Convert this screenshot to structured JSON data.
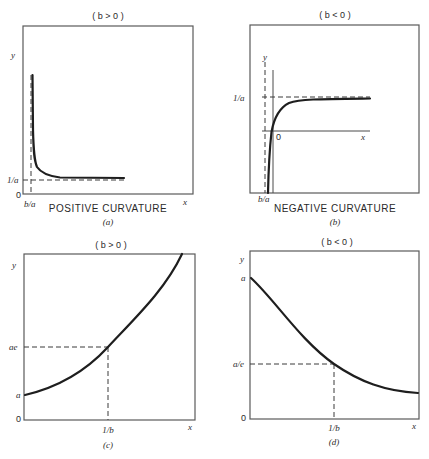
{
  "panels": [
    {
      "id": "a",
      "condition": "( b > 0 )",
      "caption": "POSITIVE CURVATURE",
      "sublabel": "(a)",
      "x_axis_label": "x",
      "y_axis_label": "y",
      "origin_label": "0",
      "y_marker_label": "1/a",
      "x_marker_label": "b/a",
      "curve": "hyperbola decreasing toward asymptote y = 1/a, vertical asymptote x = b/a"
    },
    {
      "id": "b",
      "condition": "( b < 0 )",
      "caption": "NEGATIVE CURVATURE",
      "sublabel": "(b)",
      "x_axis_label": "x",
      "y_axis_label": "y",
      "origin_label": "0",
      "y_marker_label": "1/a",
      "x_marker_label": "b/a",
      "curve": "hyperbola increasing toward asymptote y = 1/a, vertical asymptote x = b/a"
    },
    {
      "id": "c",
      "condition": "( b > 0 )",
      "caption": "",
      "sublabel": "(c)",
      "x_axis_label": "x",
      "y_axis_label": "y",
      "origin_label": "0",
      "y_intercept_label": "a",
      "y_marker_label": "ae",
      "x_marker_label": "1/b",
      "curve": "exponential growth y = a·e^(bx)"
    },
    {
      "id": "d",
      "condition": "( b < 0 )",
      "caption": "",
      "sublabel": "(d)",
      "x_axis_label": "x",
      "y_axis_label": "y",
      "origin_label": "0",
      "y_intercept_label": "a",
      "y_marker_label": "a/e",
      "x_marker_label": "1/b",
      "curve": "exponential decay y = a·e^(-|b|x)"
    }
  ]
}
